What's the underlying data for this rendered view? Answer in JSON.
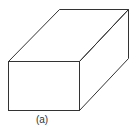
{
  "figure": {
    "label": "(a)",
    "shape": "rectangular-box-oblique-projection",
    "stroke_color": "#333333",
    "background": "#ffffff"
  }
}
